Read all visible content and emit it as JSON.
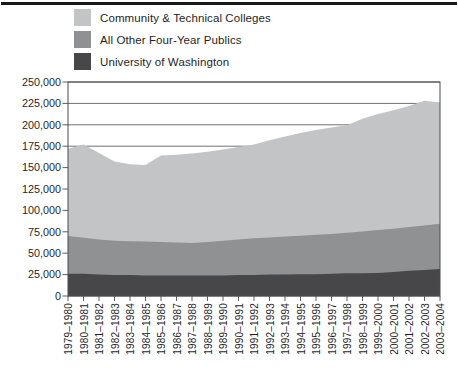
{
  "figure": {
    "type": "stacked-area-enrollment-figure"
  },
  "legend": {
    "items": [
      {
        "label": "Community & Technical Colleges",
        "color": "#c3c4c6"
      },
      {
        "label": "All Other Four-Year Publics",
        "color": "#8f9193"
      },
      {
        "label": "University of Washington",
        "color": "#47474a"
      }
    ]
  },
  "chart_data": {
    "type": "area",
    "stacked": true,
    "title": "",
    "xlabel": "",
    "ylabel": "",
    "ylim": [
      0,
      250000
    ],
    "ytick_interval": 25000,
    "ytick_labels": [
      "0",
      "25,000",
      "50,000",
      "75,000",
      "100,000",
      "125,000",
      "150,000",
      "175,000",
      "200,000",
      "225,000",
      "250,000"
    ],
    "grid": "horizontal",
    "legend_position": "top-left",
    "axis_color": "#4d4d4d",
    "text_color": "#1f1f1f",
    "categories": [
      "1979–1980",
      "1980–1981",
      "1981–1982",
      "1982–1983",
      "1983–1984",
      "1984–1985",
      "1985–1986",
      "1986–1987",
      "1987–1988",
      "1988–1989",
      "1989–1990",
      "1990–1991",
      "1991–1992",
      "1992–1993",
      "1993–1994",
      "1994–1995",
      "1995–1996",
      "1996–1997",
      "1997–1998",
      "1998–1999",
      "1999–2000",
      "2000–2001",
      "2001–2002",
      "2002–2003",
      "2003–2004"
    ],
    "series": [
      {
        "name": "University of Washington",
        "color": "#47474a",
        "values": [
          26000,
          26000,
          25000,
          24500,
          24500,
          24000,
          24000,
          24000,
          24000,
          24000,
          24000,
          24500,
          24500,
          25000,
          25000,
          25500,
          25500,
          26000,
          26500,
          26500,
          27000,
          28000,
          29500,
          30500,
          31500
        ]
      },
      {
        "name": "All Other Four-Year Publics",
        "color": "#8f9193",
        "values": [
          44000,
          42000,
          41000,
          40000,
          39500,
          39500,
          39000,
          38500,
          38000,
          39000,
          40500,
          41500,
          43000,
          43500,
          44500,
          45000,
          46000,
          46500,
          47500,
          49000,
          50000,
          50500,
          51000,
          52000,
          53000
        ]
      },
      {
        "name": "Community & Technical Colleges",
        "color": "#c3c4c6",
        "values": [
          102000,
          109000,
          101000,
          92500,
          90000,
          89500,
          101000,
          102500,
          104500,
          105500,
          106500,
          108000,
          109500,
          113500,
          117000,
          120000,
          122500,
          124500,
          125500,
          131500,
          135500,
          138500,
          141500,
          145500,
          141500
        ]
      }
    ]
  }
}
